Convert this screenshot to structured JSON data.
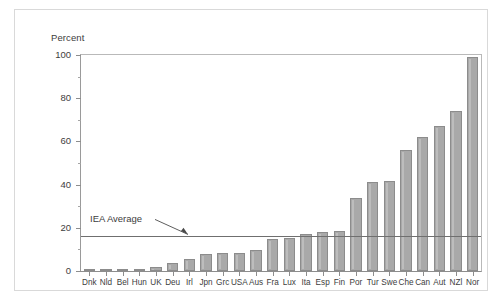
{
  "chart_data": {
    "type": "bar",
    "title": "",
    "xlabel": "",
    "ylabel": "Percent",
    "ylim": [
      0,
      100
    ],
    "ytick_values": [
      0,
      20,
      40,
      60,
      80,
      100
    ],
    "ytick_labels": [
      "0",
      "20",
      "40",
      "60",
      "80",
      "100"
    ],
    "yminor_tick_values": [
      10,
      30,
      50,
      70,
      90
    ],
    "grid": false,
    "legend": null,
    "categories": [
      "Dnk",
      "Nld",
      "Bel",
      "Hun",
      "UK",
      "Deu",
      "Irl",
      "Jpn",
      "Grc",
      "USA",
      "Aus",
      "Fra",
      "Lux",
      "Ita",
      "Esp",
      "Fin",
      "Por",
      "Tur",
      "Swe",
      "Che",
      "Can",
      "Aut",
      "NZl",
      "Nor"
    ],
    "values": [
      0.3,
      0.5,
      0.8,
      1.0,
      2.0,
      3.5,
      5.5,
      8.0,
      8.5,
      8.5,
      9.5,
      15.0,
      15.5,
      17.0,
      18.0,
      18.5,
      34.0,
      41.0,
      41.5,
      56.0,
      62.0,
      67.0,
      74.0,
      99.0
    ],
    "annotations": [
      {
        "text": "IEA Average",
        "value": 16.0,
        "type": "reference-line-with-arrow"
      }
    ]
  },
  "colors": {
    "bar_fill": "#a9a9a9",
    "bar_edge": "#8c8c8c",
    "axis": "#8d8d8d",
    "text": "#3d3d3d",
    "reference_line": "#6f6f6f",
    "frame": "#d9d9d9",
    "background": "#ffffff"
  }
}
